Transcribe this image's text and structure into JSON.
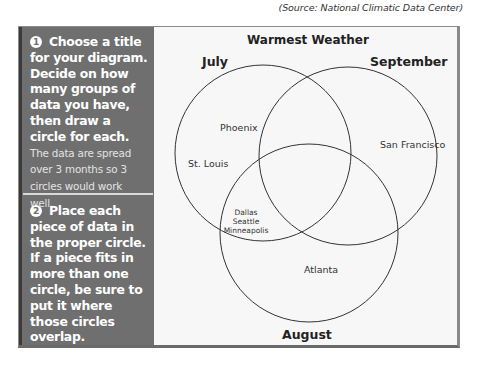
{
  "source": "(Source: National Climatic Data Center)",
  "steps": [
    {
      "number": "1",
      "bold_text": "Choose a title for your diagram. Decide on how many groups of data you have, then draw a circle for each.",
      "light_text": "The data are spread over 3 months so 3 circles would work well."
    },
    {
      "number": "2",
      "bold_text": "Place each piece of data in the proper circle. If a piece fits in more than one circle, be sure to put it where those circles overlap.",
      "light_text": ""
    }
  ],
  "diagram": {
    "title": "Warmest Weather",
    "sets": {
      "july": "July",
      "september": "September",
      "august": "August"
    },
    "regions": {
      "july_only": [
        "Phoenix",
        "St. Louis"
      ],
      "september_only": "San Francisco",
      "august_only": "Atlanta",
      "july_august": [
        "Dallas",
        "Seattle",
        "Minneapolis"
      ]
    }
  },
  "colors": {
    "panel_bg": "#6f6f6f",
    "diagram_bg": "#f7f7f7",
    "circle_stroke": "#333333"
  }
}
